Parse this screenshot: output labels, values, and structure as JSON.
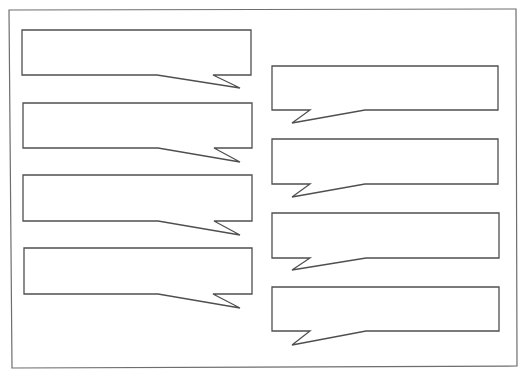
{
  "canvas": {
    "width": 526,
    "height": 375,
    "background": "#ffffff"
  },
  "frame": {
    "stroke": "#6e6e6e"
  },
  "bubbles": {
    "stroke": "#4f4f4f",
    "left_column": [
      {
        "text": ""
      },
      {
        "text": ""
      },
      {
        "text": ""
      },
      {
        "text": ""
      }
    ],
    "right_column": [
      {
        "text": ""
      },
      {
        "text": ""
      },
      {
        "text": ""
      },
      {
        "text": ""
      }
    ]
  }
}
